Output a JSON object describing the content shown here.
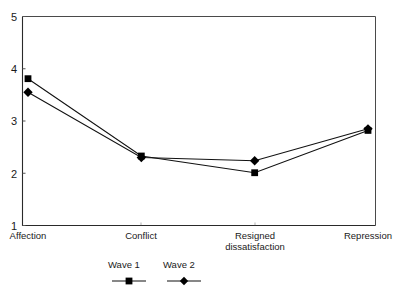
{
  "chart_data": {
    "type": "line",
    "title": "",
    "subtitle": "",
    "xlabel": "",
    "ylabel": "",
    "ylim": [
      1,
      5
    ],
    "yticks": [
      "1",
      "2",
      "3",
      "4",
      "5"
    ],
    "grid": false,
    "legend_position": "bottom",
    "categories": [
      "Affection",
      "Conflict",
      "Resigned dissatisfaction",
      "Repression"
    ],
    "category_lines": [
      [
        "Affection"
      ],
      [
        "Conflict"
      ],
      [
        "Resigned",
        "dissatisfaction"
      ],
      [
        "Repression"
      ]
    ],
    "series": [
      {
        "name": "Wave 1",
        "marker": "square",
        "color": "#000000",
        "values": [
          3.81,
          2.33,
          2.01,
          2.82
        ]
      },
      {
        "name": "Wave 2",
        "marker": "diamond",
        "color": "#000000",
        "values": [
          3.55,
          2.3,
          2.24,
          2.85
        ]
      }
    ]
  },
  "axis": {
    "y_tick_1": "1",
    "y_tick_2": "2",
    "y_tick_3": "3",
    "y_tick_4": "4",
    "y_tick_5": "5"
  },
  "categories": {
    "c0_line0": "Affection",
    "c1_line0": "Conflict",
    "c2_line0": "Resigned",
    "c2_line1": "dissatisfaction",
    "c3_line0": "Repression"
  },
  "legend": {
    "items": [
      {
        "label": "Wave 1",
        "marker": "square-marker"
      },
      {
        "label": "Wave 2",
        "marker": "diamond-marker"
      }
    ],
    "wave1_label": "Wave 1",
    "wave2_label": "Wave 2"
  }
}
